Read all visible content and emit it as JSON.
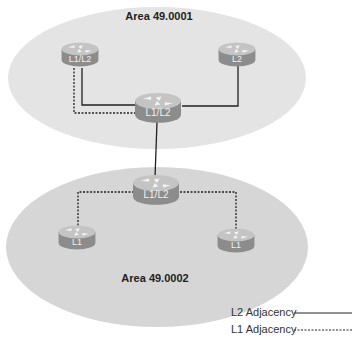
{
  "areas": [
    {
      "label": "Area 49.0001",
      "fill": "#e4e4e4"
    },
    {
      "label": "Area 49.0002",
      "fill": "#d6d6d6"
    }
  ],
  "routers": [
    {
      "id": "r-top-left",
      "label": "L1/L2"
    },
    {
      "id": "r-top-right",
      "label": "L2"
    },
    {
      "id": "r-top-center",
      "label": "L1/L2"
    },
    {
      "id": "r-bottom-center",
      "label": "L1/L2"
    },
    {
      "id": "r-bottom-left",
      "label": "L1"
    },
    {
      "id": "r-bottom-right",
      "label": "L1"
    }
  ],
  "links": [
    {
      "from": "r-top-left",
      "to": "r-top-center",
      "type": "L2 Adjacency",
      "style": "solid"
    },
    {
      "from": "r-top-left",
      "to": "r-top-center",
      "type": "L1 Adjacency",
      "style": "dashed"
    },
    {
      "from": "r-top-right",
      "to": "r-top-center",
      "type": "L2 Adjacency",
      "style": "solid"
    },
    {
      "from": "r-top-center",
      "to": "r-bottom-center",
      "type": "L2 Adjacency",
      "style": "solid"
    },
    {
      "from": "r-bottom-center",
      "to": "r-bottom-left",
      "type": "L1 Adjacency",
      "style": "dashed"
    },
    {
      "from": "r-bottom-center",
      "to": "r-bottom-right",
      "type": "L1 Adjacency",
      "style": "dashed"
    }
  ],
  "legend": {
    "l2": "L2 Adjacency",
    "l1": "L1 Adjacency"
  },
  "colors": {
    "router_top": "#c4c4c4",
    "router_body": "#8c8c8c",
    "line": "#222222"
  }
}
